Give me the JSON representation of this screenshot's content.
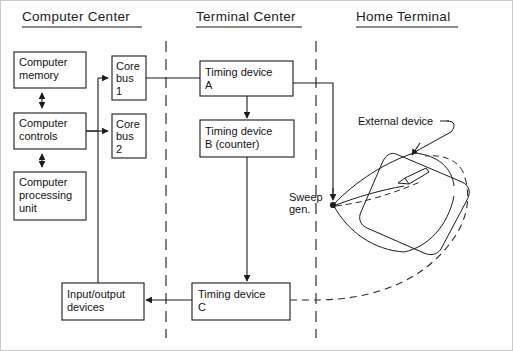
{
  "figure": {
    "type": "block-diagram",
    "background_color": "#ffffff",
    "line_color": "#1b1b1b"
  },
  "sections": [
    {
      "id": "computer-center",
      "title": "Computer Center"
    },
    {
      "id": "terminal-center",
      "title": "Terminal Center"
    },
    {
      "id": "home-terminal",
      "title": "Home Terminal"
    }
  ],
  "boxes": {
    "computer_memory": {
      "line1": "Computer",
      "line2": "memory"
    },
    "computer_controls": {
      "line1": "Computer",
      "line2": "controls"
    },
    "computer_processing_unit": {
      "line1": "Computer",
      "line2": "processing",
      "line3": "unit"
    },
    "core_bus_1": {
      "line1": "Core",
      "line2": "bus",
      "line3": "1"
    },
    "core_bus_2": {
      "line1": "Core",
      "line2": "bus",
      "line3": "2"
    },
    "input_output_devices": {
      "line1": "Input/output",
      "line2": "devices"
    },
    "timing_device_a": {
      "line1": "Timing device",
      "line2": "A"
    },
    "timing_device_b": {
      "line1": "Timing device",
      "line2": "B (counter)"
    },
    "timing_device_c": {
      "line1": "Timing device",
      "line2": "C"
    }
  },
  "annotations": {
    "sweep_gen": {
      "line1": "Sweep",
      "line2": "gen."
    },
    "external_device": {
      "label": "External device"
    }
  }
}
